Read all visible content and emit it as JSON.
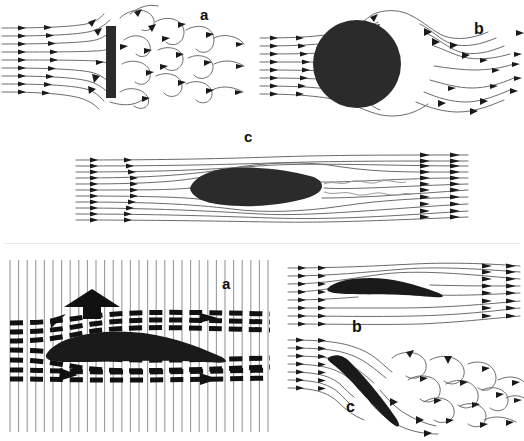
{
  "figure": {
    "title_visible": false,
    "background_color": "#ffffff",
    "ink_color": "#1a1a1a",
    "body_fill_color": "#2b2b2b",
    "streamline_color": "#6b6b6b",
    "grid_line_color": "#9a9a9a",
    "divider_color": "#e9e9e9",
    "width": 524,
    "height": 441
  },
  "upper_figure": {
    "name": "flow-past-bluff-and-streamlined-bodies",
    "panels": [
      {
        "id": "upper-a",
        "label": "a",
        "label_x": 205,
        "label_y": 20,
        "body": "flat-plate-normal-to-flow",
        "body_description": "vertical flat plate",
        "wake": "broad turbulent separated wake with vortices",
        "inlet_streamline_count": 9,
        "arrowheads_on_inlet": 2
      },
      {
        "id": "upper-b",
        "label": "b",
        "label_x": 479,
        "label_y": 34,
        "body": "circular-cylinder",
        "body_description": "circle / cylinder cross-section",
        "wake": "separated wake with recirculation, narrower than plate",
        "inlet_streamline_count": 8,
        "arrowheads_on_inlet": 2
      },
      {
        "id": "upper-c",
        "label": "c",
        "label_x": 249,
        "label_y": 142,
        "body": "streamlined-teardrop",
        "body_description": "streamlined teardrop / fairing",
        "wake": "thin attached wake, streamlines close smoothly",
        "inlet_streamline_count": 11,
        "arrowheads_on_inlet": 2
      }
    ]
  },
  "lower_figure": {
    "name": "airfoil-lift-and-stall",
    "panels": [
      {
        "id": "lower-a",
        "label": "a",
        "label_x": 229,
        "label_y": 283,
        "body": "airfoil-section",
        "body_description": "cambered airfoil in vertical tuft/smoke grid",
        "grid": "vertical reference lines",
        "grid_line_count": 31,
        "flow_marks": "dashed horizontal streak lines (spark/smoke pulses)",
        "annotation_arrow": "lift-arrow-up",
        "annotation_arrow_direction": "up",
        "flow_arrows": [
          "upper-surface-arrow-right",
          "lower-surface-arrow-right"
        ]
      },
      {
        "id": "lower-b",
        "label": "b",
        "label_x": 356,
        "label_y": 326,
        "body": "airfoil-section-low-angle",
        "body_description": "airfoil at small angle of attack",
        "wake": "attached flow, smooth streamlines",
        "inlet_streamline_count": 8,
        "arrowheads_on_inlet": 2
      },
      {
        "id": "lower-c",
        "label": "c",
        "label_x": 353,
        "label_y": 412,
        "body": "airfoil-section-high-angle",
        "body_description": "airfoil at large angle of attack (stalled)",
        "wake": "massive separation with vortices above and behind",
        "inlet_streamline_count": 7,
        "arrowheads_on_inlet": 2
      }
    ]
  }
}
